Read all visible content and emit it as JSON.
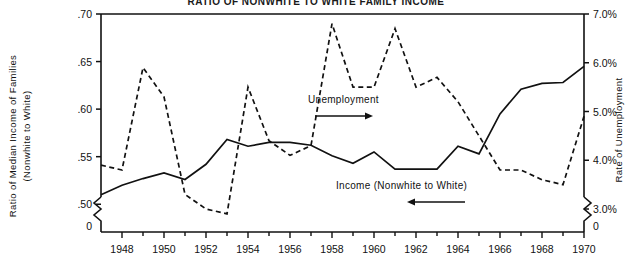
{
  "title": "RATIO OF NONWHITE TO WHITE FAMILY INCOME",
  "axes": {
    "left": {
      "label": "Ratio of Median Income of Families",
      "label2": "(Nonwhite to White)",
      "ticks": [
        ".70",
        ".65",
        ".60",
        ".55",
        ".50",
        "0"
      ],
      "values": [
        0.7,
        0.65,
        0.6,
        0.55,
        0.5,
        0.0
      ]
    },
    "right": {
      "label": "Rate of Unemployment",
      "ticks": [
        "7.0%",
        "6.0%",
        "5.0%",
        "4.0%",
        "3.0%",
        "0"
      ],
      "values": [
        7.0,
        6.0,
        5.0,
        4.0,
        3.0,
        0.0
      ]
    },
    "bottom": {
      "ticks": [
        "1948",
        "1950",
        "1952",
        "1954",
        "1956",
        "1958",
        "1960",
        "1962",
        "1964",
        "1966",
        "1968",
        "1970"
      ],
      "tick_years": [
        1948,
        1950,
        1952,
        1954,
        1956,
        1958,
        1960,
        1962,
        1964,
        1966,
        1968,
        1970
      ]
    }
  },
  "annotations": {
    "unemployment": {
      "text": "Unemployment",
      "arrow": "right-arrow"
    },
    "income": {
      "text": "Income (Nonwhite to White)",
      "arrow": "left-arrow"
    }
  },
  "colors": {
    "ink": "#111111",
    "background": "#ffffff"
  },
  "chart_data": {
    "type": "line",
    "title": "RATIO OF NONWHITE TO WHITE FAMILY INCOME",
    "xlabel": "",
    "ylabel": "Ratio of Median Income of Families (Nonwhite to White)",
    "y2label": "Rate of Unemployment",
    "xlim": [
      1947,
      1970
    ],
    "ylim": [
      0.485,
      0.7
    ],
    "y2lim": [
      2.8,
      7.0
    ],
    "grid": false,
    "legend_position": "inline-annotation",
    "x": [
      1947,
      1948,
      1949,
      1950,
      1951,
      1952,
      1953,
      1954,
      1955,
      1956,
      1957,
      1958,
      1959,
      1960,
      1961,
      1962,
      1963,
      1964,
      1965,
      1966,
      1967,
      1968,
      1969,
      1970
    ],
    "series": [
      {
        "name": "Income (Nonwhite to White)",
        "style": "solid",
        "axis": "left",
        "unit": "ratio",
        "values": [
          0.51,
          0.52,
          0.527,
          0.533,
          0.526,
          0.542,
          0.568,
          0.561,
          0.565,
          0.565,
          0.562,
          0.551,
          0.543,
          0.555,
          0.537,
          0.537,
          0.537,
          0.561,
          0.553,
          0.595,
          0.621,
          0.627,
          0.628,
          0.645
        ]
      },
      {
        "name": "Unemployment",
        "style": "dashed",
        "axis": "right",
        "unit": "percent",
        "values": [
          3.9,
          3.8,
          5.9,
          5.3,
          3.3,
          3.0,
          2.9,
          5.5,
          4.4,
          4.1,
          4.3,
          6.8,
          5.5,
          5.5,
          6.7,
          5.5,
          5.7,
          5.2,
          4.5,
          3.8,
          3.8,
          3.6,
          3.5,
          4.9
        ]
      }
    ]
  }
}
